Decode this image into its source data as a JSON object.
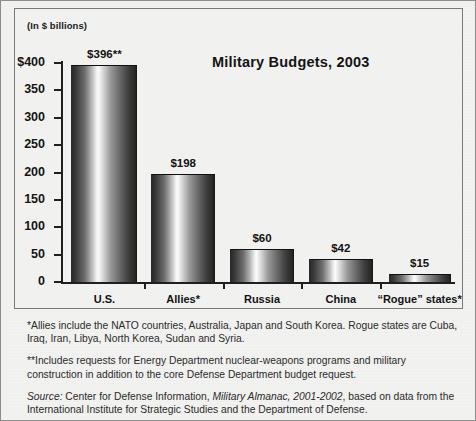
{
  "chart_data": {
    "type": "bar",
    "title": "Military Budgets, 2003",
    "units_label": "(In $ billions)",
    "categories": [
      "U.S.",
      "Allies*",
      "Russia",
      "China",
      "“Rogue” states*"
    ],
    "values": [
      396,
      198,
      60,
      42,
      15
    ],
    "value_labels": [
      "$396**",
      "$198",
      "$60",
      "$42",
      "$15"
    ],
    "xlabel": "",
    "ylabel": "(In $ billions)",
    "ylim": [
      0,
      400
    ],
    "yticks": [
      0,
      50,
      100,
      150,
      200,
      250,
      300,
      350,
      400
    ],
    "ytick_labels": [
      "0",
      "50",
      "100",
      "150",
      "200",
      "250",
      "300",
      "350",
      "$400"
    ],
    "grid": false,
    "legend": "none"
  },
  "notes": {
    "allies": "*Allies include the NATO countries, Australia, Japan and South Korea. Rogue states are Cuba, Iraq, Iran, Libya, North Korea, Sudan and Syria.",
    "includes": "**Includes requests for Energy Department nuclear-weapons programs and military construction in addition to the core Defense Department budget request.",
    "source_word": "Source:",
    "source_pre": " Center for Defense Information, ",
    "source_title": "Military Almanac, 2001-2002",
    "source_post": ", based on data from the International Institute for Strategic Studies and the Department of Defense."
  },
  "colors": {
    "background": "#f2f2f0",
    "axis": "#1f1f1f",
    "frame": "#7a7a78",
    "text": "#141414"
  }
}
